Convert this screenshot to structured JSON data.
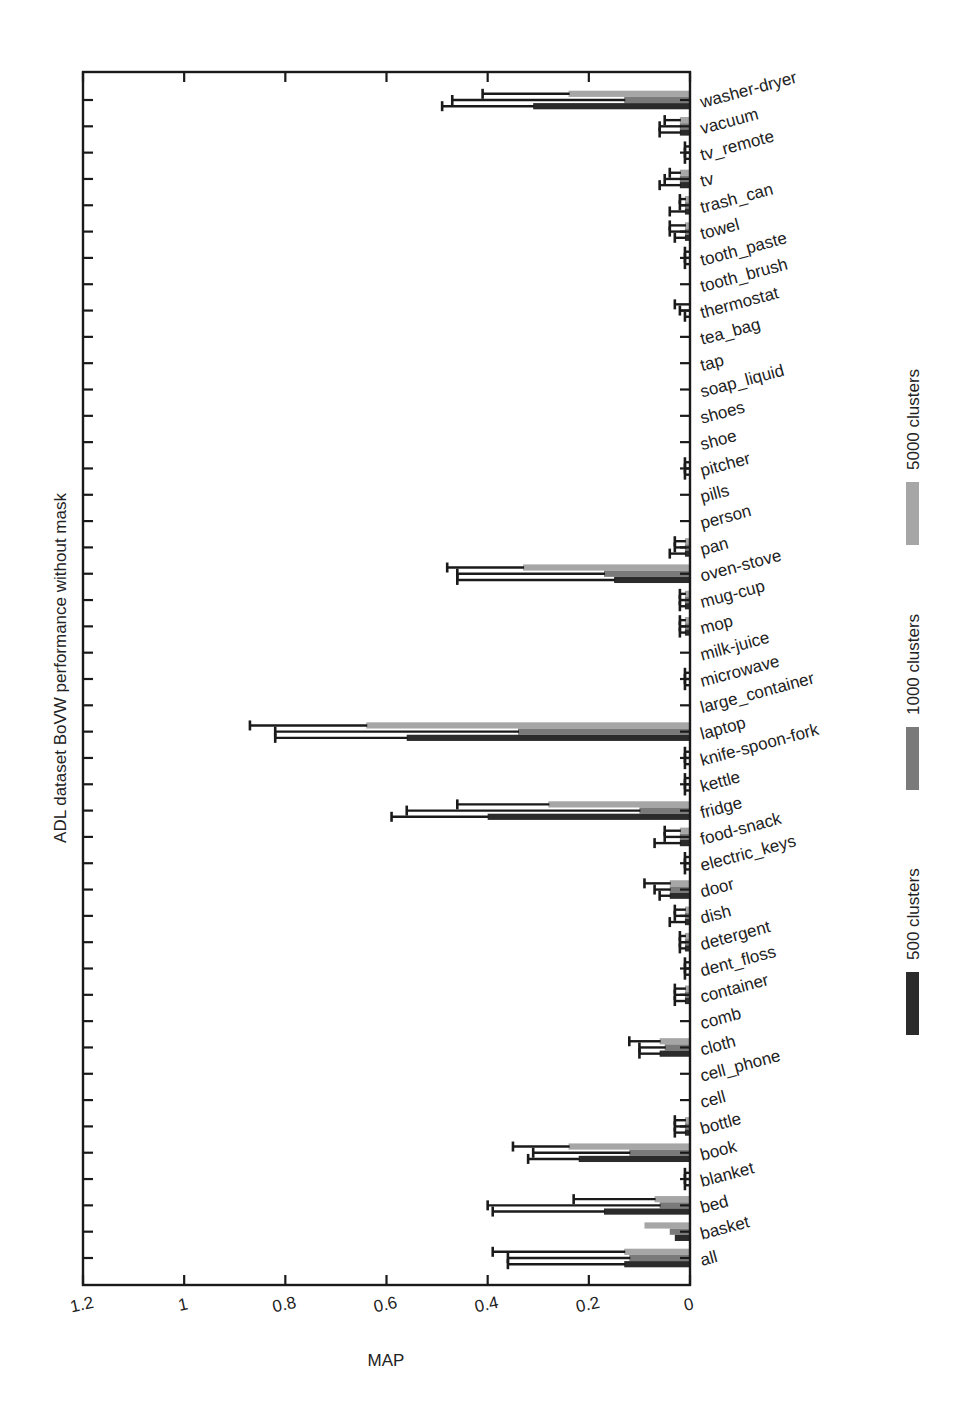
{
  "chart_data": {
    "type": "bar",
    "orientation": "horizontal",
    "title": "",
    "xlabel": "MAP",
    "ylabel": "ADL dataset BoVW performance without mask",
    "xlim": [
      0,
      1.2
    ],
    "x_reversed": true,
    "x_ticks": [
      "1.2",
      "1",
      "0.8",
      "0.6",
      "0.4",
      "0.2",
      "0"
    ],
    "grid": false,
    "legend_position": "right",
    "legend": [
      "500 clusters",
      "1000 clusters",
      "5000 clusters"
    ],
    "colors": {
      "500 clusters": "#2b2b2b",
      "1000 clusters": "#7a7a7a",
      "5000 clusters": "#a6a6a6"
    },
    "categories": [
      "washer-dryer",
      "vacuum",
      "tv_remote",
      "tv",
      "trash_can",
      "towel",
      "tooth_paste",
      "tooth_brush",
      "thermostat",
      "tea_bag",
      "tap",
      "soap_liquid",
      "shoes",
      "shoe",
      "pitcher",
      "pills",
      "person",
      "pan",
      "oven-stove",
      "mug-cup",
      "mop",
      "milk-juice",
      "microwave",
      "large_container",
      "laptop",
      "knife-spoon-fork",
      "kettle",
      "fridge",
      "food-snack",
      "electric_keys",
      "door",
      "dish",
      "detergent",
      "dent_floss",
      "container",
      "comb",
      "cloth",
      "cell_phone",
      "cell",
      "bottle",
      "book",
      "blanket",
      "bed",
      "basket",
      "all"
    ],
    "series": [
      {
        "name": "5000 clusters",
        "values": [
          0.24,
          0.02,
          0.0,
          0.02,
          0.01,
          0.01,
          0.0,
          0.0,
          0.0,
          0.0,
          0.0,
          0.0,
          0.0,
          0.0,
          0.0,
          0.0,
          0.0,
          0.01,
          0.33,
          0.01,
          0.01,
          0.0,
          0.0,
          0.0,
          0.64,
          0.0,
          0.0,
          0.28,
          0.02,
          0.0,
          0.04,
          0.01,
          0.01,
          0.0,
          0.01,
          0.0,
          0.06,
          0.0,
          0.0,
          0.01,
          0.24,
          0.0,
          0.07,
          0.09,
          0.13
        ],
        "error_upper": [
          0.41,
          0.05,
          0.01,
          0.04,
          0.02,
          0.04,
          0.01,
          0.0,
          0.03,
          0.0,
          0.0,
          0.0,
          0.0,
          0.0,
          0.01,
          0.0,
          0.0,
          0.03,
          0.48,
          0.02,
          0.02,
          0.0,
          0.01,
          0.0,
          0.87,
          0.01,
          0.01,
          0.46,
          0.05,
          0.01,
          0.09,
          0.03,
          0.02,
          0.01,
          0.03,
          0.0,
          0.12,
          0.0,
          0.0,
          0.03,
          0.35,
          0.01,
          0.23,
          0.09,
          0.39
        ]
      },
      {
        "name": "1000 clusters",
        "values": [
          0.13,
          0.02,
          0.0,
          0.02,
          0.01,
          0.01,
          0.0,
          0.0,
          0.0,
          0.0,
          0.0,
          0.0,
          0.0,
          0.0,
          0.0,
          0.0,
          0.0,
          0.01,
          0.17,
          0.01,
          0.01,
          0.0,
          0.0,
          0.0,
          0.34,
          0.0,
          0.0,
          0.1,
          0.02,
          0.0,
          0.04,
          0.01,
          0.01,
          0.0,
          0.01,
          0.0,
          0.05,
          0.0,
          0.0,
          0.01,
          0.12,
          0.0,
          0.06,
          0.04,
          0.12
        ],
        "error_upper": [
          0.47,
          0.06,
          0.01,
          0.05,
          0.02,
          0.04,
          0.01,
          0.0,
          0.02,
          0.0,
          0.0,
          0.0,
          0.0,
          0.0,
          0.01,
          0.0,
          0.0,
          0.03,
          0.46,
          0.02,
          0.02,
          0.0,
          0.01,
          0.0,
          0.82,
          0.01,
          0.01,
          0.56,
          0.05,
          0.01,
          0.07,
          0.03,
          0.02,
          0.01,
          0.03,
          0.0,
          0.1,
          0.0,
          0.0,
          0.03,
          0.31,
          0.01,
          0.4,
          0.04,
          0.36
        ]
      },
      {
        "name": "500 clusters",
        "values": [
          0.31,
          0.02,
          0.0,
          0.02,
          0.01,
          0.01,
          0.0,
          0.0,
          0.0,
          0.0,
          0.0,
          0.0,
          0.0,
          0.0,
          0.0,
          0.0,
          0.0,
          0.01,
          0.15,
          0.01,
          0.01,
          0.0,
          0.0,
          0.0,
          0.56,
          0.0,
          0.0,
          0.4,
          0.02,
          0.0,
          0.04,
          0.01,
          0.01,
          0.0,
          0.01,
          0.0,
          0.06,
          0.0,
          0.0,
          0.01,
          0.22,
          0.0,
          0.17,
          0.03,
          0.13
        ],
        "error_upper": [
          0.49,
          0.06,
          0.01,
          0.06,
          0.04,
          0.03,
          0.01,
          0.0,
          0.01,
          0.0,
          0.0,
          0.0,
          0.0,
          0.0,
          0.01,
          0.0,
          0.0,
          0.04,
          0.46,
          0.02,
          0.02,
          0.0,
          0.01,
          0.0,
          0.82,
          0.01,
          0.01,
          0.59,
          0.07,
          0.01,
          0.06,
          0.04,
          0.02,
          0.01,
          0.03,
          0.0,
          0.1,
          0.0,
          0.0,
          0.03,
          0.32,
          0.01,
          0.39,
          0.02,
          0.36
        ]
      }
    ]
  }
}
